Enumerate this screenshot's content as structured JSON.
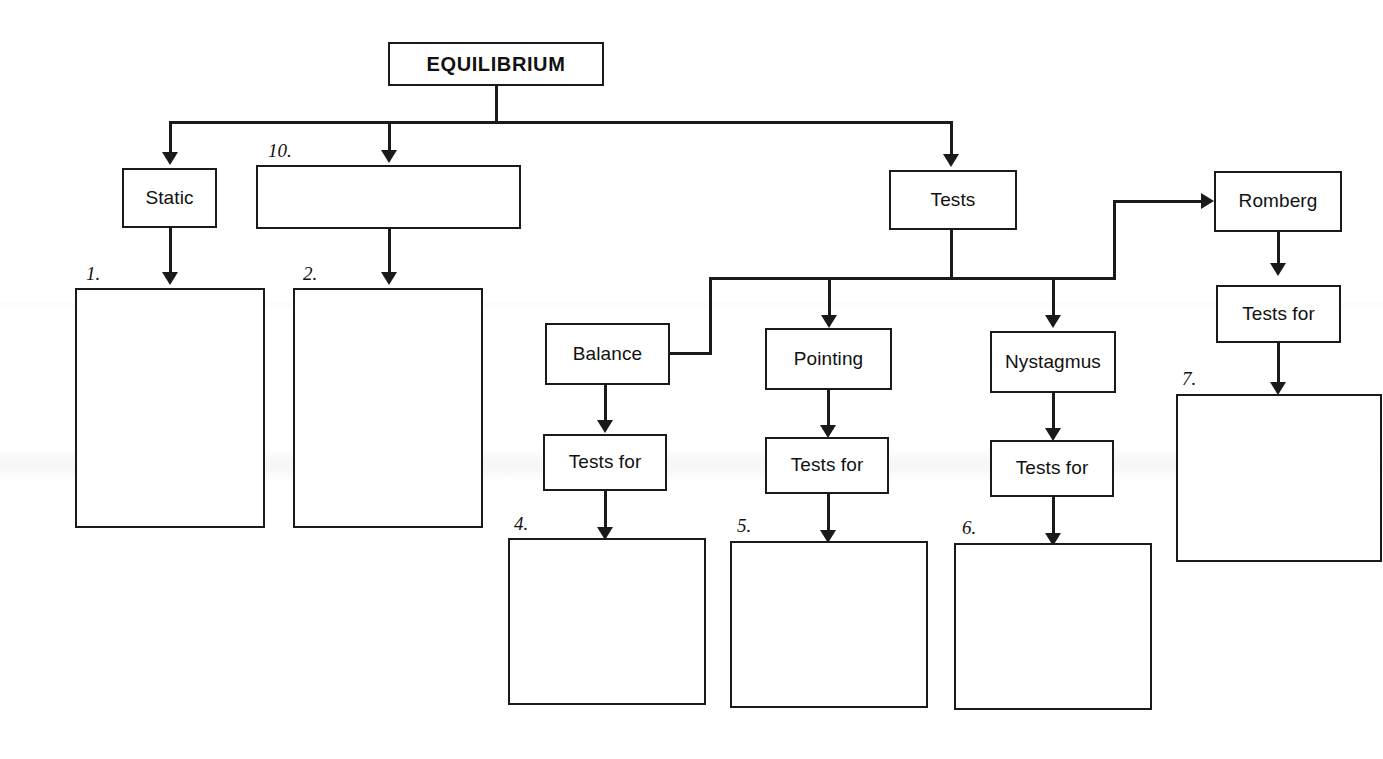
{
  "document": {
    "kind": "flow-chart-worksheet",
    "root_label": "EQUILIBRIUM"
  },
  "nodes": {
    "equilibrium": {
      "label": "EQUILIBRIUM"
    },
    "static": {
      "label": "Static"
    },
    "blank_10": {
      "label": ""
    },
    "tests": {
      "label": "Tests"
    },
    "romberg": {
      "label": "Romberg"
    },
    "balance": {
      "label": "Balance"
    },
    "pointing": {
      "label": "Pointing"
    },
    "nystagmus": {
      "label": "Nystagmus"
    },
    "tests_for_balance": {
      "label": "Tests for"
    },
    "tests_for_pointing": {
      "label": "Tests for"
    },
    "tests_for_nystagmus": {
      "label": "Tests for"
    },
    "tests_for_romberg": {
      "label": "Tests for"
    },
    "blank_1": {
      "label": ""
    },
    "blank_2": {
      "label": ""
    },
    "blank_4": {
      "label": ""
    },
    "blank_5": {
      "label": ""
    },
    "blank_6": {
      "label": ""
    },
    "blank_7": {
      "label": ""
    }
  },
  "numbers": {
    "n1": "1.",
    "n2": "2.",
    "n4": "4.",
    "n5": "5.",
    "n6": "6.",
    "n7": "7.",
    "n10": "10."
  },
  "colors": {
    "ink": "#1a1a1a",
    "page": "#ffffff"
  }
}
